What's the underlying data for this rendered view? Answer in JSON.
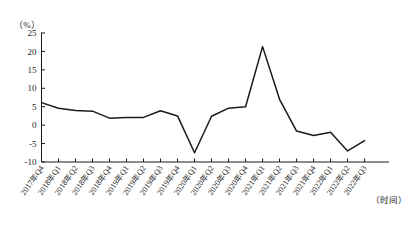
{
  "chart_data": {
    "type": "line",
    "title": "",
    "unit_label": "（%）",
    "xlabel": "（时间）",
    "ylabel": "",
    "ylim": [
      -10,
      25
    ],
    "ytick_step": 5,
    "yticks": [
      25,
      20,
      15,
      10,
      5,
      0,
      -5,
      -10
    ],
    "grid": false,
    "legend": "none",
    "categories": [
      "2017年Q4",
      "2018年Q1",
      "2018年Q2",
      "2018年Q3",
      "2018年Q4",
      "2019年Q1",
      "2019年Q2",
      "2019年Q3",
      "2019年Q4",
      "2020年Q1",
      "2020年Q2",
      "2020年Q3",
      "2020年Q4",
      "2021年Q1",
      "2021年Q2",
      "2021年Q3",
      "2021年Q4",
      "2022年Q1",
      "2022年Q2",
      "2022年Q3"
    ],
    "values": [
      6.1,
      4.6,
      4.0,
      3.8,
      1.9,
      2.1,
      2.1,
      3.9,
      2.5,
      -7.5,
      2.4,
      4.6,
      5.0,
      21.3,
      7.0,
      -1.6,
      -2.8,
      -1.9,
      -7.0,
      -4.2
    ]
  },
  "caption": {
    "text": ""
  }
}
